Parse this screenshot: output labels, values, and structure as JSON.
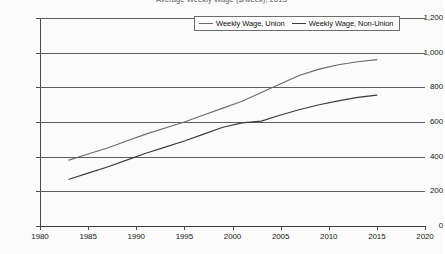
{
  "chart_data": {
    "type": "line",
    "title": "Average Weekly Wage ($/week), 2015",
    "xlabel": "",
    "ylabel": "",
    "xlim": [
      1980,
      2020
    ],
    "ylim": [
      0,
      1200
    ],
    "grid": true,
    "legend_position": "top-center",
    "x_ticks": [
      "1980",
      "1985",
      "1990",
      "1995",
      "2000",
      "2005",
      "2010",
      "2015",
      "2020"
    ],
    "y_ticks": [
      "0",
      "200",
      "400",
      "600",
      "800",
      "1,000",
      "1,200"
    ],
    "x_tick_values": [
      1980,
      1985,
      1990,
      1995,
      2000,
      2005,
      2010,
      2015,
      2020
    ],
    "y_tick_values": [
      0,
      200,
      400,
      600,
      800,
      1000,
      1200
    ],
    "series": [
      {
        "name": "Weekly Wage, Union",
        "color": "#6b6b6b",
        "x": [
          1983,
          1985,
          1987,
          1989,
          1991,
          1993,
          1995,
          1997,
          1999,
          2001,
          2003,
          2005,
          2007,
          2009,
          2011,
          2013,
          2015
        ],
        "values": [
          380,
          415,
          450,
          490,
          530,
          565,
          600,
          640,
          680,
          720,
          770,
          820,
          870,
          905,
          930,
          948,
          960
        ]
      },
      {
        "name": "Weekly Wage, Non-Union",
        "color": "#3b3b3b",
        "x": [
          1983,
          1985,
          1987,
          1989,
          1991,
          1993,
          1995,
          1997,
          1999,
          2001,
          2003,
          2005,
          2007,
          2009,
          2011,
          2013,
          2015
        ],
        "values": [
          270,
          305,
          340,
          380,
          420,
          455,
          490,
          530,
          570,
          595,
          605,
          640,
          672,
          700,
          722,
          742,
          755
        ]
      }
    ]
  },
  "legend": {
    "entries": [
      {
        "label": "Weekly Wage, Union"
      },
      {
        "label": "Weekly Wage, Non-Union"
      }
    ]
  }
}
